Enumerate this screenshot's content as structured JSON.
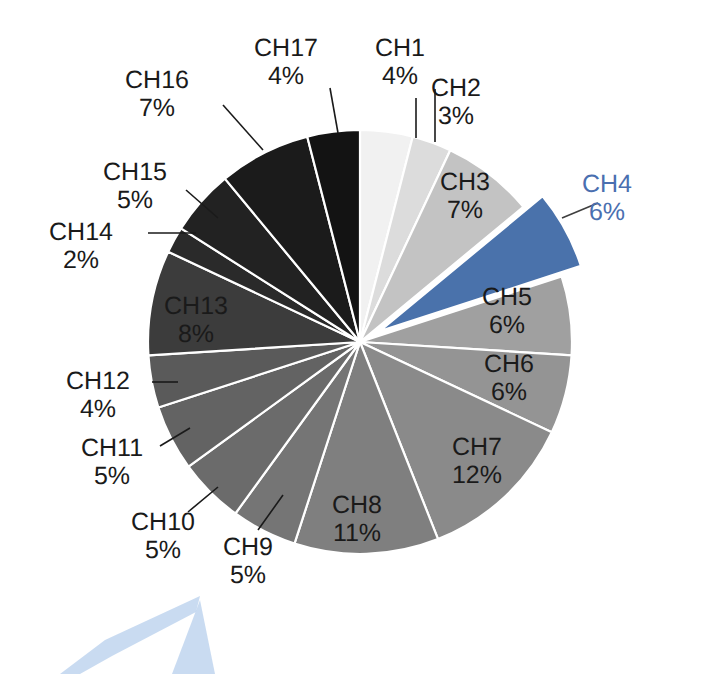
{
  "chart_data": {
    "type": "pie",
    "title": "",
    "subtitle": "",
    "xlabel": "",
    "ylabel": "",
    "legend_position": "none",
    "grid": false,
    "units": "percent",
    "start_angle_deg": 0,
    "direction": "clockwise",
    "total": 100,
    "categories": [
      "CH1",
      "CH2",
      "CH3",
      "CH4",
      "CH5",
      "CH6",
      "CH7",
      "CH8",
      "CH9",
      "CH10",
      "CH11",
      "CH12",
      "CH13",
      "CH14",
      "CH15",
      "CH16",
      "CH17"
    ],
    "values": [
      4,
      3,
      7,
      6,
      6,
      6,
      12,
      11,
      5,
      5,
      5,
      4,
      8,
      2,
      5,
      7,
      4
    ],
    "slices": [
      {
        "name": "CH1",
        "value": 4,
        "label": "CH1",
        "value_label": "4%",
        "color": "#f1f1f1",
        "exploded": false,
        "highlight": false,
        "label_placement": "outside",
        "label_x": 400,
        "label_y": 56,
        "leader": [
          [
            416,
            98
          ],
          [
            416,
            138
          ]
        ]
      },
      {
        "name": "CH2",
        "value": 3,
        "label": "CH2",
        "value_label": "3%",
        "color": "#dcdcdc",
        "exploded": false,
        "highlight": false,
        "label_placement": "outside",
        "label_x": 456,
        "label_y": 96,
        "leader": [
          [
            435,
            89
          ],
          [
            435,
            142
          ]
        ]
      },
      {
        "name": "CH3",
        "value": 7,
        "label": "CH3",
        "value_label": "7%",
        "color": "#c3c3c3",
        "exploded": false,
        "highlight": false,
        "label_placement": "inside",
        "label_x": 465,
        "label_y": 190,
        "leader": null
      },
      {
        "name": "CH4",
        "value": 6,
        "label": "CH4",
        "value_label": "6%",
        "color": "#4a72ab",
        "exploded": true,
        "highlight": true,
        "label_placement": "outside",
        "label_x": 607,
        "label_y": 192,
        "leader": [
          [
            598,
            203
          ],
          [
            562,
            218
          ]
        ]
      },
      {
        "name": "CH5",
        "value": 6,
        "label": "CH5",
        "value_label": "6%",
        "color": "#a0a0a0",
        "exploded": false,
        "highlight": false,
        "label_placement": "inside",
        "label_x": 507,
        "label_y": 305,
        "leader": null
      },
      {
        "name": "CH6",
        "value": 6,
        "label": "CH6",
        "value_label": "6%",
        "color": "#949494",
        "exploded": false,
        "highlight": false,
        "label_placement": "inside",
        "label_x": 509,
        "label_y": 372,
        "leader": null
      },
      {
        "name": "CH7",
        "value": 12,
        "label": "CH7",
        "value_label": "12%",
        "color": "#8a8a8a",
        "exploded": false,
        "highlight": false,
        "label_placement": "inside",
        "label_x": 477,
        "label_y": 455,
        "leader": null
      },
      {
        "name": "CH8",
        "value": 11,
        "label": "CH8",
        "value_label": "11%",
        "color": "#7f7f7f",
        "exploded": false,
        "highlight": false,
        "label_placement": "inside",
        "label_x": 357,
        "label_y": 513,
        "leader": null
      },
      {
        "name": "CH9",
        "value": 5,
        "label": "CH9",
        "value_label": "5%",
        "color": "#757575",
        "exploded": false,
        "highlight": false,
        "label_placement": "outside",
        "label_x": 248,
        "label_y": 555,
        "leader": [
          [
            258,
            530
          ],
          [
            283,
            495
          ]
        ]
      },
      {
        "name": "CH10",
        "value": 5,
        "label": "CH10",
        "value_label": "5%",
        "color": "#6b6b6b",
        "exploded": false,
        "highlight": false,
        "label_placement": "outside",
        "label_x": 163,
        "label_y": 530,
        "leader": [
          [
            188,
            512
          ],
          [
            218,
            487
          ]
        ]
      },
      {
        "name": "CH11",
        "value": 5,
        "label": "CH11",
        "value_label": "5%",
        "color": "#636363",
        "exploded": false,
        "highlight": false,
        "label_placement": "outside",
        "label_x": 112,
        "label_y": 456,
        "leader": [
          [
            160,
            446
          ],
          [
            190,
            428
          ]
        ]
      },
      {
        "name": "CH12",
        "value": 4,
        "label": "CH12",
        "value_label": "4%",
        "color": "#5a5a5a",
        "exploded": false,
        "highlight": false,
        "label_placement": "outside",
        "label_x": 98,
        "label_y": 389,
        "leader": [
          [
            152,
            382
          ],
          [
            178,
            382
          ]
        ]
      },
      {
        "name": "CH13",
        "value": 8,
        "label": "CH13",
        "value_label": "8%",
        "color": "#3c3c3c",
        "exploded": false,
        "highlight": false,
        "label_placement": "inside",
        "label_x": 196,
        "label_y": 314,
        "leader": null
      },
      {
        "name": "CH14",
        "value": 2,
        "label": "CH14",
        "value_label": "2%",
        "color": "#2a2a2a",
        "exploded": false,
        "highlight": false,
        "label_placement": "outside",
        "label_x": 81,
        "label_y": 240,
        "leader": [
          [
            148,
            233
          ],
          [
            196,
            233
          ]
        ]
      },
      {
        "name": "CH15",
        "value": 5,
        "label": "CH15",
        "value_label": "5%",
        "color": "#222222",
        "exploded": false,
        "highlight": false,
        "label_placement": "outside",
        "label_x": 135,
        "label_y": 180,
        "leader": [
          [
            186,
            190
          ],
          [
            218,
            218
          ]
        ]
      },
      {
        "name": "CH16",
        "value": 7,
        "label": "CH16",
        "value_label": "7%",
        "color": "#1b1b1b",
        "exploded": false,
        "highlight": false,
        "label_placement": "outside",
        "label_x": 157,
        "label_y": 88,
        "leader": [
          [
            223,
            105
          ],
          [
            263,
            150
          ]
        ]
      },
      {
        "name": "CH17",
        "value": 4,
        "label": "CH17",
        "value_label": "4%",
        "color": "#131313",
        "exploded": false,
        "highlight": false,
        "label_placement": "outside",
        "label_x": 286,
        "label_y": 56,
        "leader": [
          [
            330,
            88
          ],
          [
            338,
            133
          ]
        ]
      }
    ],
    "geometry": {
      "center_x": 360,
      "center_y": 342,
      "radius": 212,
      "explode_offset": 22,
      "separator_color": "#ffffff",
      "separator_width": 2.2
    }
  },
  "watermark": {
    "name": "watermark-mark",
    "color": "#bfd5ef"
  }
}
